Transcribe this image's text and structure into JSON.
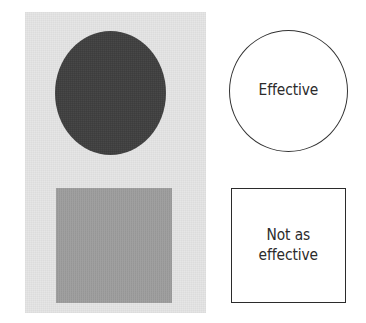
{
  "figure": {
    "background_color": "#ffffff",
    "width": 366,
    "height": 323
  },
  "photo_panel": {
    "background_color": "#e6e6e6",
    "swatches": [
      {
        "name": "dark-circle",
        "shape": "circle",
        "fill_color": "#3d3d3d",
        "tone": "dark"
      },
      {
        "name": "gray-square",
        "shape": "square",
        "fill_color": "#9a9a9a",
        "tone": "medium gray"
      }
    ]
  },
  "labels": {
    "circle": {
      "text": "Effective",
      "shape": "circle",
      "stroke_color": "#333333",
      "fill_color": "#ffffff"
    },
    "square": {
      "text": "Not as\neffective",
      "shape": "square",
      "stroke_color": "#2b2b2b",
      "fill_color": "#ffffff"
    }
  }
}
